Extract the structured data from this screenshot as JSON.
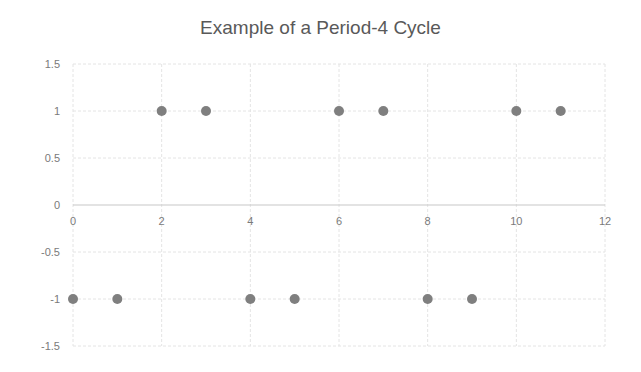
{
  "chart_data": {
    "type": "scatter",
    "title": "Example of a Period-4 Cycle",
    "xlabel": "",
    "ylabel": "",
    "xlim": [
      0,
      12
    ],
    "ylim": [
      -1.5,
      1.5
    ],
    "x_ticks": [
      0,
      2,
      4,
      6,
      8,
      10,
      12
    ],
    "y_ticks": [
      1.5,
      1,
      0.5,
      0,
      -0.5,
      -1,
      -1.5
    ],
    "x_tick_labels": [
      "0",
      "2",
      "4",
      "6",
      "8",
      "10",
      "12"
    ],
    "y_tick_labels": [
      "1.5",
      "1",
      "0.5",
      "0",
      "-0.5",
      "-1",
      "-1.5"
    ],
    "grid": true,
    "legend": null,
    "series": [
      {
        "name": "Series1",
        "color": "#7f7f7f",
        "points": [
          {
            "x": 0,
            "y": -1
          },
          {
            "x": 1,
            "y": -1
          },
          {
            "x": 2,
            "y": 1
          },
          {
            "x": 3,
            "y": 1
          },
          {
            "x": 4,
            "y": -1
          },
          {
            "x": 5,
            "y": -1
          },
          {
            "x": 6,
            "y": 1
          },
          {
            "x": 7,
            "y": 1
          },
          {
            "x": 8,
            "y": -1
          },
          {
            "x": 9,
            "y": -1
          },
          {
            "x": 10,
            "y": 1
          },
          {
            "x": 11,
            "y": 1
          }
        ]
      }
    ]
  },
  "colors": {
    "gridline": "#e4e4e4",
    "axis": "#c8c8c8",
    "tick_label": "#7a7a7a",
    "title": "#595959",
    "marker": "#7f7f7f"
  }
}
